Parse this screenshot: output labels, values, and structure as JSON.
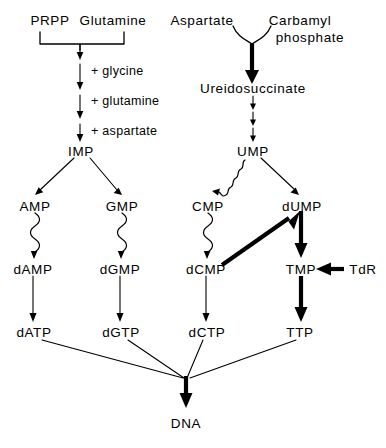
{
  "diagram": {
    "ink_color": "#000000",
    "background_color": "#ffffff"
  },
  "nodes": {
    "prpp": "PRPP",
    "glutamine": "Glutamine",
    "aspartate": "Aspartate",
    "carbamyl_line1": "Carbamyl",
    "carbamyl_line2": "phosphate",
    "ureidosuccinate": "Ureidosuccinate",
    "imp": "IMP",
    "ump": "UMP",
    "amp": "AMP",
    "gmp": "GMP",
    "cmp": "CMP",
    "dump": "dUMP",
    "damp": "dAMP",
    "dgmp": "dGMP",
    "dcmp": "dCMP",
    "tmp": "TMP",
    "tdr": "TdR",
    "datp": "dATP",
    "dgtp": "dGTP",
    "dctp": "dCTP",
    "ttp": "TTP",
    "dna": "DNA"
  },
  "cofactors": {
    "glycine": "+ glycine",
    "glutamine": "+ glutamine",
    "aspartate": "+ aspartate"
  },
  "edges": [
    {
      "id": "prpp-glutamine-bracket",
      "from": "PRPP + Glutamine",
      "to": "purine chain",
      "style": "bracket-thin-arrow"
    },
    {
      "id": "step-glycine",
      "from": "purine chain",
      "to": "purine chain",
      "style": "thin-arrow",
      "label": "+ glycine"
    },
    {
      "id": "step-glutamine",
      "from": "purine chain",
      "to": "purine chain",
      "style": "thin-arrow",
      "label": "+ glutamine"
    },
    {
      "id": "step-aspartate",
      "from": "purine chain",
      "to": "IMP",
      "style": "thin-arrow",
      "label": "+ aspartate"
    },
    {
      "id": "aspartate-carbamyl-to-ureidosuccinate",
      "from": "Aspartate + Carbamyl phosphate",
      "to": "Ureidosuccinate",
      "style": "curved-junction-bold-arrow"
    },
    {
      "id": "ureidosuccinate-to-ump",
      "from": "Ureidosuccinate",
      "to": "UMP",
      "style": "three-thin-arrows"
    },
    {
      "id": "imp-to-amp",
      "from": "IMP",
      "to": "AMP",
      "style": "thin-diagonal-arrow"
    },
    {
      "id": "imp-to-gmp",
      "from": "IMP",
      "to": "GMP",
      "style": "thin-diagonal-arrow"
    },
    {
      "id": "ump-to-cmp",
      "from": "UMP",
      "to": "CMP",
      "style": "wavy-diagonal-arrow"
    },
    {
      "id": "ump-to-dump",
      "from": "UMP",
      "to": "dUMP",
      "style": "thin-diagonal-arrow"
    },
    {
      "id": "amp-to-damp",
      "from": "AMP",
      "to": "dAMP",
      "style": "wavy-arrow"
    },
    {
      "id": "gmp-to-dgmp",
      "from": "GMP",
      "to": "dGMP",
      "style": "wavy-arrow"
    },
    {
      "id": "cmp-to-dcmp",
      "from": "CMP",
      "to": "dCMP",
      "style": "wavy-arrow"
    },
    {
      "id": "dump-to-tmp",
      "from": "dUMP",
      "to": "TMP",
      "style": "bold-arrow"
    },
    {
      "id": "dcmp-to-dump",
      "from": "dCMP",
      "to": "dUMP",
      "style": "bold-diagonal-arrow"
    },
    {
      "id": "tdr-to-tmp",
      "from": "TdR",
      "to": "TMP",
      "style": "bold-left-arrow"
    },
    {
      "id": "damp-to-datp",
      "from": "dAMP",
      "to": "dATP",
      "style": "thin-arrow"
    },
    {
      "id": "dgmp-to-dgtp",
      "from": "dGMP",
      "to": "dGTP",
      "style": "thin-arrow"
    },
    {
      "id": "dcmp-to-dctp",
      "from": "dCMP",
      "to": "dCTP",
      "style": "thin-arrow"
    },
    {
      "id": "tmp-to-ttp",
      "from": "TMP",
      "to": "TTP",
      "style": "bold-arrow"
    },
    {
      "id": "datp-to-dna",
      "from": "dATP",
      "to": "DNA",
      "style": "thin-converging-line"
    },
    {
      "id": "dgtp-to-dna",
      "from": "dGTP",
      "to": "DNA",
      "style": "thin-converging-line"
    },
    {
      "id": "dctp-to-dna",
      "from": "dCTP",
      "to": "DNA",
      "style": "thin-converging-line"
    },
    {
      "id": "ttp-to-dna",
      "from": "TTP",
      "to": "DNA",
      "style": "thin-converging-line"
    },
    {
      "id": "converge-to-dna",
      "from": "convergence point",
      "to": "DNA",
      "style": "bold-arrow"
    }
  ]
}
